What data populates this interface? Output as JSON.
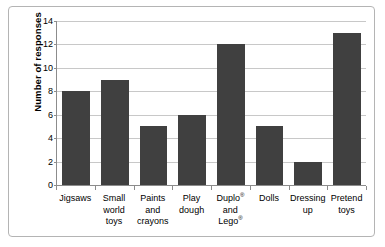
{
  "chart_data": {
    "type": "bar",
    "title": "",
    "xlabel": "",
    "ylabel": "Number of responses",
    "ylim": [
      0,
      14
    ],
    "ytick_step": 2,
    "yticks": [
      14,
      12,
      10,
      8,
      6,
      4,
      2,
      0
    ],
    "grid": true,
    "legend": "none",
    "bar_color": "#404040",
    "gridline_color": "#c8c8c8",
    "axis_color": "#8c8c8c",
    "border_color": "#b4b4b4",
    "background_color": "#ffffff",
    "categories": [
      "Jigsaws",
      "Small world toys",
      "Paints and crayons",
      "Play dough",
      "Duplo® and Lego®",
      "Dolls",
      "Dressing up",
      "Pretend toys"
    ],
    "category_lines": [
      [
        "Jigsaws"
      ],
      [
        "Small",
        "world",
        "toys"
      ],
      [
        "Paints",
        "and",
        "crayons"
      ],
      [
        "Play",
        "dough"
      ],
      [
        "Duplo®",
        "and",
        "Lego®"
      ],
      [
        "Dolls"
      ],
      [
        "Dressing",
        "up"
      ],
      [
        "Pretend",
        "toys"
      ]
    ],
    "values": [
      8,
      9,
      5,
      6,
      12,
      5,
      2,
      13
    ]
  }
}
